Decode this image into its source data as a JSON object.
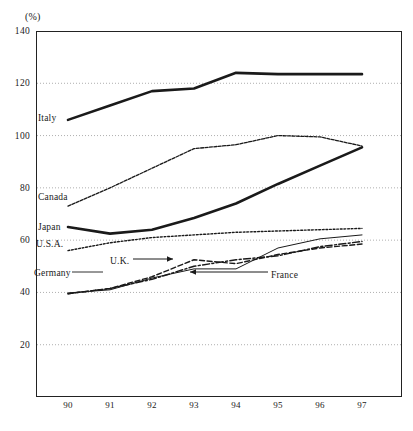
{
  "chart_data": {
    "type": "line",
    "title": "",
    "subtitle": "",
    "xlabel": "",
    "ylabel": "",
    "unit_label": "(%)",
    "x": [
      "90",
      "91",
      "92",
      "93",
      "94",
      "95",
      "96",
      "97"
    ],
    "xtick_labels": [
      "90",
      "91",
      "92",
      "93",
      "94",
      "95",
      "96",
      "97"
    ],
    "ytick_labels": [
      "140",
      "120",
      "100",
      "80",
      "60",
      "40",
      "20"
    ],
    "ytick_values": [
      140,
      120,
      100,
      80,
      60,
      40,
      20
    ],
    "ylim": [
      0,
      140
    ],
    "xlim": [
      "90",
      "97"
    ],
    "grid": "horizontal-dotted",
    "legend": "inline-labels",
    "series": [
      {
        "name": "Italy",
        "style": "thick-solid",
        "label_x": 38,
        "label_y": 118,
        "values": [
          106.0,
          111.5,
          117.0,
          118.0,
          124.0,
          123.5,
          123.5,
          123.5
        ]
      },
      {
        "name": "Canada",
        "style": "fine-dotted",
        "label_x": 38,
        "label_y": 197,
        "values": [
          73.0,
          80.0,
          87.5,
          95.0,
          96.5,
          100.0,
          99.5,
          96.0
        ]
      },
      {
        "name": "Japan",
        "style": "thick-solid",
        "label_x": 38,
        "label_y": 227,
        "values": [
          65.0,
          62.5,
          64.0,
          68.5,
          74.0,
          81.5,
          88.5,
          95.5
        ]
      },
      {
        "name": "U.S.A.",
        "style": "small-dotted",
        "label_x": 36,
        "label_y": 244,
        "values": [
          56.0,
          59.0,
          61.0,
          62.0,
          63.0,
          63.5,
          64.0,
          64.5
        ]
      },
      {
        "name": "Germany",
        "style": "thin-solid",
        "label_x": 34,
        "label_y": 273,
        "values": [
          39.8,
          41.0,
          45.5,
          49.0,
          49.0,
          57.0,
          60.5,
          62.0
        ]
      },
      {
        "name": "U.K.",
        "style": "dashed",
        "label_x": 110,
        "label_y": 261,
        "values": [
          39.5,
          41.5,
          46.0,
          52.5,
          51.0,
          54.5,
          57.0,
          58.5
        ]
      },
      {
        "name": "France",
        "style": "dash-dot",
        "label_x": 271,
        "label_y": 275,
        "values": [
          39.5,
          41.5,
          45.0,
          50.0,
          52.5,
          54.0,
          57.5,
          59.5
        ]
      }
    ],
    "annotations": [
      {
        "name": "uk-callout",
        "text": "U.K.",
        "arrow": "right"
      },
      {
        "name": "france-callout",
        "text": "France",
        "arrow": "left"
      }
    ],
    "colors": {
      "line": "#1a1a1a",
      "axis": "#222222",
      "grid": "#9a9a9a",
      "background": "#ffffff"
    }
  }
}
